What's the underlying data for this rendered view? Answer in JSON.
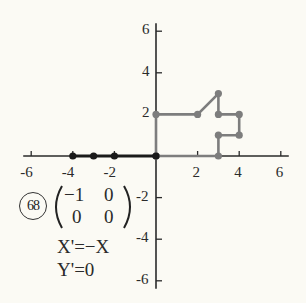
{
  "problem_number": "68",
  "matrix": {
    "row1": [
      "−1",
      "0"
    ],
    "row2": [
      "0",
      "0"
    ]
  },
  "equations": [
    "X'=−X",
    "Y'=0"
  ],
  "colors": {
    "original": "#7d7d7d",
    "image": "#1a1a1a",
    "axes": "#2a2a2a"
  },
  "chart_data": {
    "type": "line",
    "title": "",
    "xlabel": "",
    "ylabel": "",
    "xlim": [
      -6,
      6
    ],
    "ylim": [
      -6,
      6
    ],
    "x_ticks": [
      -6,
      -4,
      -2,
      2,
      4,
      6
    ],
    "y_ticks": [
      6,
      4,
      2,
      -2,
      -4,
      -6
    ],
    "grid": false,
    "series": [
      {
        "name": "original",
        "color": "#7d7d7d",
        "points": [
          [
            0,
            0
          ],
          [
            0,
            2
          ],
          [
            2,
            2
          ],
          [
            3,
            3
          ],
          [
            3,
            2
          ],
          [
            4,
            2
          ],
          [
            4,
            1
          ],
          [
            3,
            1
          ],
          [
            3,
            0
          ],
          [
            0,
            0
          ]
        ]
      },
      {
        "name": "image",
        "color": "#1a1a1a",
        "points": [
          [
            0,
            0
          ],
          [
            -2,
            0
          ],
          [
            -3,
            0
          ],
          [
            -4,
            0
          ]
        ]
      }
    ]
  }
}
